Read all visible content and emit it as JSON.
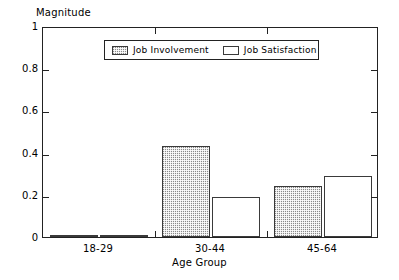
{
  "chart_data": {
    "type": "bar",
    "title": "",
    "xlabel": "Age Group",
    "ylabel": "Magnitude",
    "categories": [
      "18-29",
      "30-44",
      "45-64"
    ],
    "series": [
      {
        "name": "Job Involvement",
        "values": [
          0.01,
          0.43,
          0.24
        ],
        "fill": "hatched"
      },
      {
        "name": "Job Satisfaction",
        "values": [
          0.01,
          0.19,
          0.29
        ],
        "fill": "open"
      }
    ],
    "ylim": [
      0,
      1
    ],
    "yticks": [
      "0",
      "0.2",
      "0.4",
      "0.6",
      "0.8",
      "1"
    ],
    "ytick_values": [
      0,
      0.2,
      0.4,
      0.6,
      0.8,
      1
    ],
    "grid": false,
    "legend_position": "upper center",
    "axis_color": "#222222",
    "bar_fill_color": "#8a8a8a",
    "bar_edge_color": "#3a3a3a",
    "background_color": "#ffffff"
  }
}
